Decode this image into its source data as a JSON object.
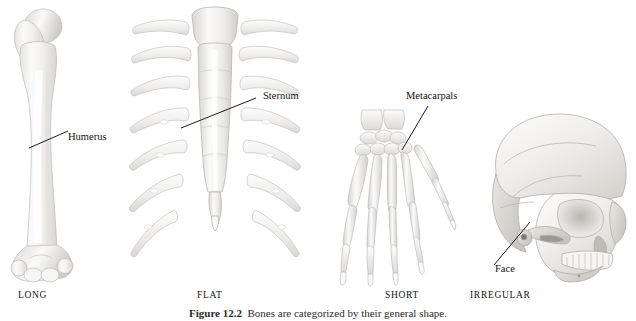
{
  "figure": {
    "background_color": "#ffffff",
    "caption_number": "Figure 12.2",
    "caption_text": "Bones are categorized by their general shape.",
    "bone_fill": "#f4f3f1",
    "bone_stroke": "#b9b7b4",
    "bone_shade": "#dedcd9",
    "leader_color": "#1a1a1a"
  },
  "panels": [
    {
      "key": "long",
      "category_label": "LONG",
      "specimen": "humerus",
      "callout": {
        "label": "Humerus"
      }
    },
    {
      "key": "flat",
      "category_label": "FLAT",
      "specimen": "sternum-and-ribs",
      "callout": {
        "label": "Sternum"
      }
    },
    {
      "key": "short",
      "category_label": "SHORT",
      "specimen": "hand-skeleton",
      "callout": {
        "label": "Metacarpals"
      }
    },
    {
      "key": "irregular",
      "category_label": "IRREGULAR",
      "specimen": "skull",
      "callout": {
        "label": "Face"
      }
    }
  ]
}
